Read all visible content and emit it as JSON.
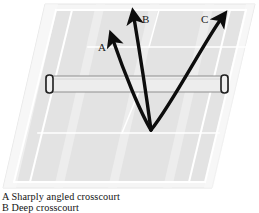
{
  "figure": {
    "court": {
      "surface_color": "#e2e2e2",
      "surface_shadow_color": "#efefef",
      "line_color": "#ffffff",
      "outer_border_color": "#f4f4f4",
      "perspective": "parallelogram skewed to the right; far baseline at top, near baseline at bottom"
    },
    "net": {
      "band_color": "#ededed",
      "edge_color": "#8a8a8a",
      "post_color": "#2a2a2a",
      "left_x": 46,
      "right_x": 228,
      "top_y": 76,
      "bottom_y": 92
    },
    "arrows": {
      "color": "#0d0d0d",
      "origin_label": "ball contact point",
      "origin": {
        "x": 151,
        "y": 130
      },
      "items": [
        {
          "id": "A",
          "label": "A",
          "label_x": 98,
          "label_y": 51,
          "tip_x": 112,
          "tip_y": 36
        },
        {
          "id": "B",
          "label": "B",
          "label_x": 142,
          "label_y": 23,
          "tip_x": 133,
          "tip_y": 13
        },
        {
          "id": "C",
          "label": "C",
          "label_x": 201,
          "label_y": 23,
          "tip_x": 224,
          "tip_y": 13
        }
      ]
    }
  },
  "caption": {
    "lines": [
      "A Sharply angled crosscourt",
      "B Deep crosscourt"
    ]
  }
}
